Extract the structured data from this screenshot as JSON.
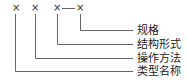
{
  "code": {
    "marks": [
      "×",
      "×",
      "×",
      "×"
    ],
    "separator": "—"
  },
  "labels": [
    {
      "text": "规格",
      "refers_to_position": 4
    },
    {
      "text": "结构形式",
      "refers_to_position": 3
    },
    {
      "text": "操作方法",
      "refers_to_position": 2
    },
    {
      "text": "类型名称",
      "refers_to_position": 1
    }
  ],
  "colors": {
    "line": "#555555",
    "text": "#222222"
  }
}
